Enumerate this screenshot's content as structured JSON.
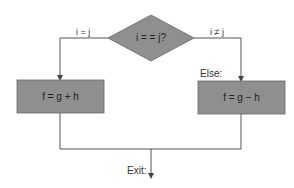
{
  "diagram": {
    "type": "flowchart",
    "decision": {
      "label": "i = = j?",
      "fill": "#8f8f8f"
    },
    "branches": {
      "true_label": "i = j",
      "false_label": "i ≠ j",
      "else_label": "Else:"
    },
    "process_true": {
      "label": "f = g + h",
      "fill": "#8f8f8f"
    },
    "process_false": {
      "label": "f = g − h",
      "fill": "#8f8f8f"
    },
    "exit_label": "Exit:",
    "line_color": "#555555"
  }
}
